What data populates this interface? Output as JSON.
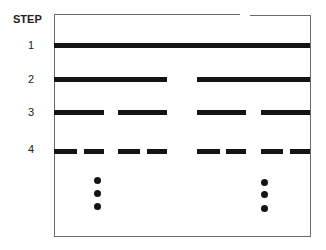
{
  "diagram": {
    "header_label": "STEP",
    "steps": [
      {
        "label": "1",
        "segments": 1
      },
      {
        "label": "2",
        "segments": 2
      },
      {
        "label": "3",
        "segments": 4
      },
      {
        "label": "4",
        "segments": 8
      }
    ],
    "continuation": "vertical ellipsis (three dots) under left and right halves",
    "colors": {
      "line": "#141414",
      "frame": "#6a6a6a",
      "background": "#ffffff"
    }
  }
}
